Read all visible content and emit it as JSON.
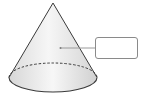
{
  "diagram": {
    "type": "geometry-cone",
    "shape": "cone",
    "apex": {
      "x": 53,
      "y": 3
    },
    "base_ellipse": {
      "cx": 53,
      "cy": 77.5,
      "rx": 44,
      "ry": 14.5,
      "back_edge_style": "dashed",
      "front_edge_style": "solid"
    },
    "pointer": {
      "from": {
        "x": 95,
        "y": 48
      },
      "to": {
        "x": 60,
        "y": 48
      },
      "target": "lateral-surface"
    },
    "label_box": {
      "text": "",
      "x": 95,
      "y": 37,
      "width": 43,
      "height": 22
    }
  },
  "colors": {
    "outline": "#3a3a3a",
    "pointer_line": "#9a9a9a",
    "fill_light": "#f4f4f4",
    "fill_mid": "#e2e2e2",
    "fill_dark": "#cfcfcf",
    "box_border": "#8a8a8a"
  }
}
